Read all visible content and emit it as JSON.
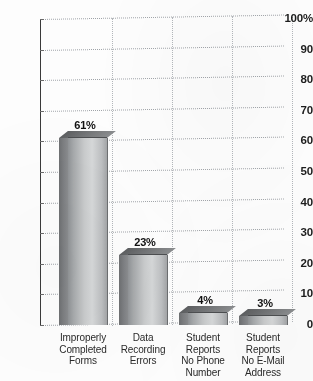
{
  "chart_data": {
    "type": "bar",
    "title": "",
    "subtitle": "",
    "xlabel": "",
    "ylabel": "",
    "categories": [
      "Improperly Completed Forms",
      "Data Recording Errors",
      "Student Reports No Phone Number",
      "Student Reports No E-Mail Address"
    ],
    "category_lines": [
      [
        "Improperly",
        "Completed",
        "Forms"
      ],
      [
        "Data",
        "Recording",
        "Errors"
      ],
      [
        "Student",
        "Reports",
        "No Phone",
        "Number"
      ],
      [
        "Student",
        "Reports",
        "No E-Mail",
        "Address"
      ]
    ],
    "values": [
      61,
      23,
      4,
      3
    ],
    "value_labels": [
      "61%",
      "23%",
      "4%",
      "3%"
    ],
    "ylim": [
      0,
      100
    ],
    "ytick_values": [
      100,
      90,
      80,
      70,
      60,
      50,
      40,
      30,
      20,
      10,
      0
    ],
    "ytick_labels": [
      "100%",
      "90",
      "80",
      "70",
      "60",
      "50",
      "40",
      "30",
      "20",
      "10",
      "0"
    ],
    "grid": "horizontal-and-vertical-dotted",
    "legend": "none",
    "style": "3d-bars-grayscale-gradient"
  },
  "colors": {
    "axis": "#3a3a3a",
    "grid": "#9fa3a8",
    "bar_front_light": "#d6d8d9",
    "bar_front_dark": "#8f9295",
    "bar_side": "#7e8083",
    "bar_top": "#6f7173",
    "label_text": "#1d1d1d",
    "background": "#fdfdfd"
  }
}
